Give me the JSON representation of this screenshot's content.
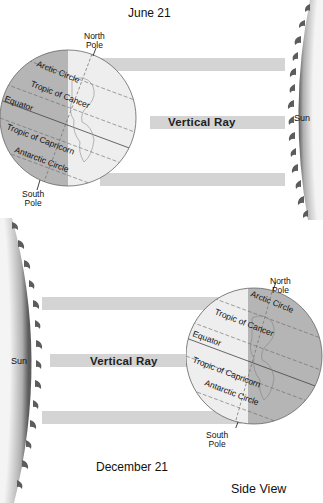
{
  "top_diagram": {
    "title": "June 21",
    "sun_label": "Sun",
    "vertical_ray_label": "Vertical Ray",
    "north_pole": [
      "North",
      "Pole"
    ],
    "south_pole": [
      "South",
      "Pole"
    ],
    "latitude_labels": [
      "Arctic Circle",
      "Tropic of Cancer",
      "Equator",
      "Tropic of Capricorn",
      "Antarctic Circle"
    ]
  },
  "bottom_diagram": {
    "title": "December 21",
    "sun_label": "Sun",
    "vertical_ray_label": "Vertical Ray",
    "north_pole": [
      "North",
      "Pole"
    ],
    "south_pole": [
      "South",
      "Pole"
    ],
    "latitude_labels": [
      "Arctic Circle",
      "Tropic of Cancer",
      "Equator",
      "Tropic of Capricorn",
      "Antarctic Circle"
    ]
  },
  "caption": "Side View",
  "colors": {
    "ray": "#d4d4d4",
    "night_side": "#b5b5b5",
    "day_side": "#eeeeee",
    "sun_edge": "#6a6a6a",
    "sun_center": "#f2f2f2"
  }
}
